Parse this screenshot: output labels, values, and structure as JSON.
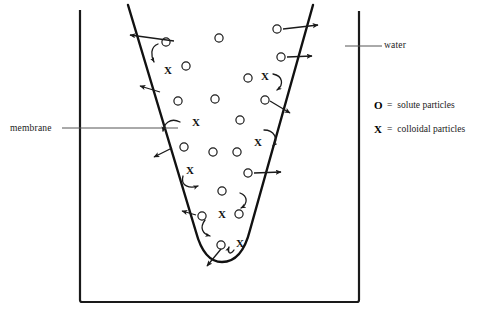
{
  "diagram": {
    "labels": {
      "membrane": "membrane",
      "water": "water"
    },
    "legend": [
      {
        "symbol": "O",
        "equals": "=",
        "text": "solute particles",
        "icon": "circle-icon"
      },
      {
        "symbol": "X",
        "equals": "=",
        "text": "colloidal particles",
        "icon": "x-icon"
      }
    ],
    "colors": {
      "stroke": "#1a1a1a",
      "leader": "#555555",
      "text": "#1a1a1a",
      "background": "#ffffff"
    },
    "beaker": {
      "left_wall_x": 80,
      "right_wall_x": 359,
      "top_y": 11,
      "bottom_y": 302,
      "stroke_width": 2.2
    },
    "membrane_bag": {
      "left_top": [
        128,
        5
      ],
      "right_top": [
        313,
        5
      ],
      "bottom_center": [
        222,
        262
      ],
      "stroke_width": 2.4
    },
    "leader_lines": {
      "membrane": {
        "from": [
          62,
          128
        ],
        "to": [
          178,
          128
        ]
      },
      "water": {
        "from": [
          345,
          46
        ],
        "to": [
          382,
          46
        ]
      }
    },
    "solute_particles": [
      {
        "cx": 166,
        "cy": 42
      },
      {
        "cx": 219,
        "cy": 38
      },
      {
        "cx": 186,
        "cy": 66
      },
      {
        "cx": 277,
        "cy": 29
      },
      {
        "cx": 281,
        "cy": 57
      },
      {
        "cx": 248,
        "cy": 78
      },
      {
        "cx": 178,
        "cy": 101
      },
      {
        "cx": 215,
        "cy": 99
      },
      {
        "cx": 265,
        "cy": 100
      },
      {
        "cx": 240,
        "cy": 120
      },
      {
        "cx": 184,
        "cy": 147
      },
      {
        "cx": 213,
        "cy": 152
      },
      {
        "cx": 237,
        "cy": 152
      },
      {
        "cx": 248,
        "cy": 173
      },
      {
        "cx": 222,
        "cy": 191
      },
      {
        "cx": 202,
        "cy": 216
      },
      {
        "cx": 239,
        "cy": 214
      },
      {
        "cx": 221,
        "cy": 245
      }
    ],
    "colloidal_particles": [
      {
        "x": 168,
        "y": 70
      },
      {
        "x": 265,
        "y": 76
      },
      {
        "x": 196,
        "y": 122
      },
      {
        "x": 258,
        "y": 142
      },
      {
        "x": 190,
        "y": 170
      },
      {
        "x": 222,
        "y": 214
      },
      {
        "x": 240,
        "y": 243
      }
    ],
    "straight_arrows": [
      {
        "from": [
          176,
          40
        ],
        "to": [
          128,
          34
        ],
        "label": "solute-exits-left-top"
      },
      {
        "from": [
          160,
          92
        ],
        "to": [
          139,
          85
        ],
        "label": "solute-exits-left-upper"
      },
      {
        "from": [
          172,
          148
        ],
        "to": [
          152,
          156
        ],
        "label": "solute-exits-left-mid"
      },
      {
        "from": [
          196,
          215
        ],
        "to": [
          180,
          210
        ],
        "label": "solute-exits-left-low"
      },
      {
        "from": [
          221,
          247
        ],
        "to": [
          205,
          266
        ],
        "label": "solute-exits-bottom"
      },
      {
        "from": [
          282,
          29
        ],
        "to": [
          320,
          24
        ],
        "label": "solute-exits-right-top"
      },
      {
        "from": [
          287,
          57
        ],
        "to": [
          313,
          55
        ],
        "label": "solute-exits-right-upper"
      },
      {
        "from": [
          271,
          100
        ],
        "to": [
          292,
          113
        ],
        "label": "solute-exits-right-mid"
      },
      {
        "from": [
          254,
          173
        ],
        "to": [
          282,
          172
        ],
        "label": "solute-exits-right-low"
      }
    ],
    "curved_arrows": [
      {
        "label": "colloid-rebound-left-top"
      },
      {
        "label": "colloid-rebound-left-upper"
      },
      {
        "label": "colloid-rebound-left-mid"
      },
      {
        "label": "colloid-rebound-left-low"
      },
      {
        "label": "colloid-rebound-right-top"
      },
      {
        "label": "colloid-rebound-right-mid"
      },
      {
        "label": "colloid-rebound-bottom"
      },
      {
        "label": "colloid-rebound-bottom-2"
      }
    ]
  }
}
